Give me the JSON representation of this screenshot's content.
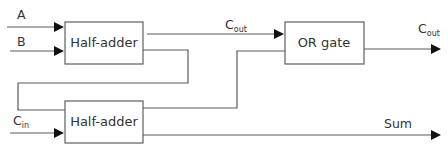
{
  "diagram": {
    "type": "full-adder block diagram",
    "inputs": {
      "a": {
        "label": "A"
      },
      "b": {
        "label": "B"
      },
      "cin": {
        "label": "C",
        "subscript": "in"
      }
    },
    "blocks": {
      "half_adder_1": {
        "label": "Half-adder"
      },
      "half_adder_2": {
        "label": "Half-adder"
      },
      "or_gate": {
        "label": "OR gate"
      }
    },
    "signals": {
      "carry_mid": {
        "label": "C",
        "subscript": "out"
      },
      "carry_out": {
        "label": "C",
        "subscript": "out"
      },
      "sum": {
        "label": "Sum"
      }
    },
    "connections": [
      {
        "from": "A",
        "to": "half_adder_1"
      },
      {
        "from": "B",
        "to": "half_adder_1"
      },
      {
        "from": "half_adder_1.carry",
        "to": "or_gate",
        "label": "C_out"
      },
      {
        "from": "half_adder_1.sum",
        "to": "half_adder_2"
      },
      {
        "from": "C_in",
        "to": "half_adder_2"
      },
      {
        "from": "half_adder_2.carry",
        "to": "or_gate"
      },
      {
        "from": "or_gate",
        "to": "output",
        "label": "C_out"
      },
      {
        "from": "half_adder_2.sum",
        "to": "output",
        "label": "Sum"
      }
    ],
    "colors": {
      "stroke": "#5a5a5a",
      "arrow": "#111111",
      "text": "#333333",
      "background": "#ffffff"
    }
  }
}
